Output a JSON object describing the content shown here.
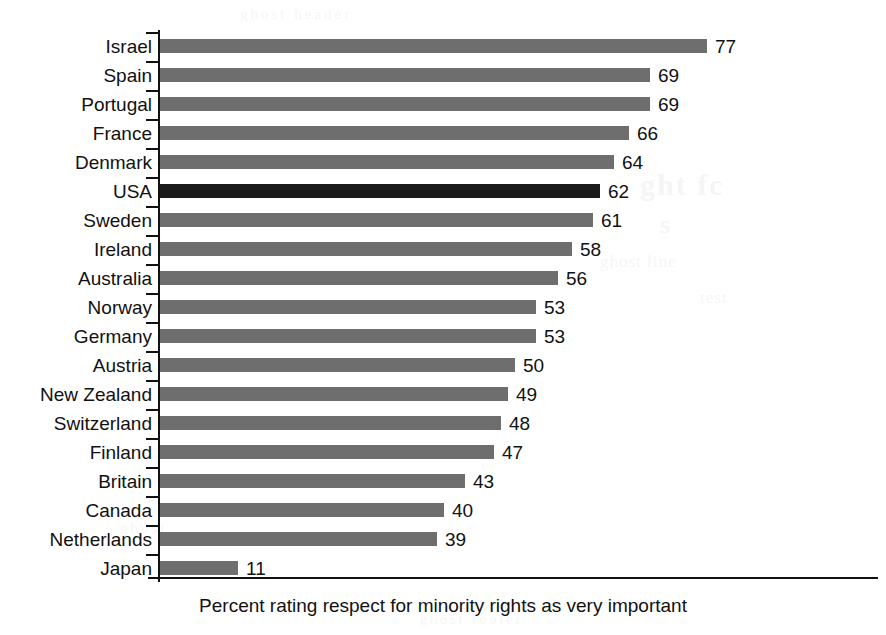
{
  "chart_data": {
    "type": "bar",
    "orientation": "horizontal",
    "title": "",
    "xlabel": "Percent rating respect for minority rights as very important",
    "ylabel": "",
    "xlim": [
      0,
      77
    ],
    "grid": false,
    "legend": null,
    "highlight_category": "USA",
    "highlight_color": "#1b1b1b",
    "bar_color": "#6e6e6e",
    "categories": [
      "Israel",
      "Spain",
      "Portugal",
      "France",
      "Denmark",
      "USA",
      "Sweden",
      "Ireland",
      "Australia",
      "Norway",
      "Germany",
      "Austria",
      "New Zealand",
      "Switzerland",
      "Finland",
      "Britain",
      "Canada",
      "Netherlands",
      "Japan"
    ],
    "values": [
      77,
      69,
      69,
      66,
      64,
      62,
      61,
      58,
      56,
      53,
      53,
      50,
      49,
      48,
      47,
      43,
      40,
      39,
      11
    ],
    "value_labels": [
      "77",
      "69",
      "69",
      "66",
      "64",
      "62",
      "61",
      "58",
      "56",
      "53",
      "53",
      "50",
      "49",
      "48",
      "47",
      "43",
      "40",
      "39",
      "11"
    ]
  },
  "caption": {
    "text": "Percent rating respect for minority rights as very important"
  },
  "ghost_text": {
    "g1": "ght fc",
    "g2": "s",
    "g3": "ghost line",
    "g4": "test",
    "g5": "ghost header",
    "g6": "ghost",
    "g7": "ghost footer"
  }
}
